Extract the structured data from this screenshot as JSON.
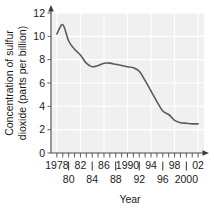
{
  "chart_data": {
    "type": "line",
    "title": "",
    "xlabel": "Year",
    "ylabel": "Concentration of sulfur dioxide (parts per billion)",
    "ylabel_line1": "Concentration of sulfur",
    "ylabel_line2": "dioxide (parts per billion)",
    "xlim": [
      1977,
      2003
    ],
    "ylim": [
      0,
      12
    ],
    "grid": true,
    "legend": false,
    "y_ticks": [
      0,
      2,
      4,
      6,
      8,
      10,
      12
    ],
    "y_tick_labels": [
      "0",
      "2",
      "4",
      "6",
      "8",
      "10",
      "12"
    ],
    "x_ticks": [
      1978,
      1979,
      1980,
      1981,
      1982,
      1983,
      1984,
      1985,
      1986,
      1987,
      1988,
      1989,
      1990,
      1991,
      1992,
      1993,
      1994,
      1995,
      1996,
      1997,
      1998,
      1999,
      2000,
      2001,
      2002
    ],
    "x_tick_labels_upper": [
      {
        "year": 1978,
        "label": "1978"
      },
      {
        "year": 1982,
        "label": "82"
      },
      {
        "year": 1986,
        "label": "86"
      },
      {
        "year": 1990,
        "label": "1990"
      },
      {
        "year": 1994,
        "label": "94"
      },
      {
        "year": 1998,
        "label": "98"
      },
      {
        "year": 2002,
        "label": "02"
      }
    ],
    "x_tick_labels_lower": [
      {
        "year": 1980,
        "label": "80"
      },
      {
        "year": 1984,
        "label": "84"
      },
      {
        "year": 1988,
        "label": "88"
      },
      {
        "year": 1992,
        "label": "92"
      },
      {
        "year": 1996,
        "label": "96"
      },
      {
        "year": 2000,
        "label": "2000"
      }
    ],
    "x": [
      1978,
      1979,
      1980,
      1981,
      1982,
      1983,
      1984,
      1985,
      1986,
      1987,
      1988,
      1989,
      1990,
      1991,
      1992,
      1993,
      1994,
      1995,
      1996,
      1997,
      1998,
      1999,
      2000,
      2001,
      2002
    ],
    "values": [
      10.2,
      11.0,
      9.6,
      8.9,
      8.4,
      7.7,
      7.4,
      7.5,
      7.7,
      7.7,
      7.6,
      7.5,
      7.4,
      7.3,
      7.0,
      6.2,
      5.3,
      4.4,
      3.6,
      3.3,
      2.8,
      2.6,
      2.55,
      2.5,
      2.5
    ],
    "series": [
      {
        "name": "Sulfur dioxide concentration",
        "color": "#5b5b5b",
        "values": [
          10.2,
          11.0,
          9.6,
          8.9,
          8.4,
          7.7,
          7.4,
          7.5,
          7.7,
          7.7,
          7.6,
          7.5,
          7.4,
          7.3,
          7.0,
          6.2,
          5.3,
          4.4,
          3.6,
          3.3,
          2.8,
          2.6,
          2.55,
          2.5,
          2.5
        ]
      }
    ],
    "colors": {
      "panel_background": "#f0f0f0",
      "gridline": "#ffffff",
      "axis": "#4a4a4a",
      "line": "#5b5b5b",
      "text": "#1a1a1a",
      "page_background": "#ffffff"
    }
  }
}
